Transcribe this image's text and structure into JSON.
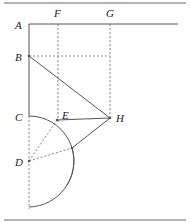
{
  "figure": {
    "stroke_color": "#555555",
    "dash_color": "#777777",
    "rule_color": "#6a6a6a",
    "label_color": "#1a1a1a",
    "canvas": {
      "width": 190,
      "height": 223
    }
  },
  "rules": {
    "top": {
      "x1": 4,
      "y1": 3,
      "x2": 186,
      "y2": 3
    },
    "bottom": {
      "x1": 4,
      "y1": 220,
      "x2": 186,
      "y2": 220
    }
  },
  "points": {
    "A": {
      "label": "A",
      "x": 29,
      "y": 24,
      "label_x": 15,
      "label_y": 29
    },
    "B": {
      "label": "B",
      "x": 29,
      "y": 56,
      "label_x": 15,
      "label_y": 61
    },
    "C": {
      "label": "C",
      "x": 29,
      "y": 116,
      "label_x": 15,
      "label_y": 121
    },
    "D": {
      "label": "D",
      "x": 29,
      "y": 161,
      "label_x": 15,
      "label_y": 166
    },
    "E": {
      "label": "E",
      "x": 57,
      "y": 120,
      "label_x": 62,
      "label_y": 119
    },
    "F": {
      "label": "F",
      "x": 58,
      "y": 24,
      "label_x": 54,
      "label_y": 17
    },
    "G": {
      "label": "G",
      "x": 110,
      "y": 24,
      "label_x": 106,
      "label_y": 17
    },
    "H": {
      "label": "H",
      "x": 110,
      "y": 118,
      "label_x": 116,
      "label_y": 122
    },
    "K": {
      "label": "",
      "x": 72,
      "y": 148,
      "label_x": 0,
      "label_y": 0
    }
  },
  "solid_segments": [
    {
      "name": "top-horizontal-AX",
      "x1": 29,
      "y1": 24,
      "x2": 178,
      "y2": 24
    },
    {
      "name": "vertical-A-to-C",
      "x1": 29,
      "y1": 24,
      "x2": 29,
      "y2": 116
    },
    {
      "name": "diagonal-B-to-H",
      "x1": 29,
      "y1": 56,
      "x2": 110,
      "y2": 118
    },
    {
      "name": "segment-E-to-H",
      "x1": 57,
      "y1": 120,
      "x2": 110,
      "y2": 118
    },
    {
      "name": "segment-H-to-K",
      "x1": 110,
      "y1": 118,
      "x2": 72,
      "y2": 148
    }
  ],
  "dashed_segments": [
    {
      "name": "vertical-F",
      "x1": 58,
      "y1": 24,
      "x2": 58,
      "y2": 122
    },
    {
      "name": "vertical-G",
      "x1": 110,
      "y1": 24,
      "x2": 110,
      "y2": 118
    },
    {
      "name": "horizontal-B-to-G",
      "x1": 29,
      "y1": 56,
      "x2": 110,
      "y2": 56
    },
    {
      "name": "vertical-C-to-bottom",
      "x1": 29,
      "y1": 116,
      "x2": 29,
      "y2": 209
    },
    {
      "name": "radius-D-to-E",
      "x1": 29,
      "y1": 161,
      "x2": 57,
      "y2": 120
    },
    {
      "name": "radius-D-to-K",
      "x1": 29,
      "y1": 161,
      "x2": 72,
      "y2": 148
    }
  ],
  "arcs": [
    {
      "name": "small-arc-centre-D-through-C-E",
      "cx": 29,
      "cy": 161,
      "r": 45,
      "start_x": 29,
      "start_y": 116,
      "end_x": 67,
      "end_y": 185,
      "path": "M 29 116 A 45 45 0 0 1 67 185"
    },
    {
      "name": "large-arc-centre-D-through-K",
      "cx": 29,
      "cy": 161,
      "r": 46,
      "start_x": 72,
      "start_y": 148,
      "end_x": 29,
      "end_y": 207,
      "path": "M 72 148 A 46 46 0 0 1 29 207"
    }
  ],
  "markers": [
    {
      "name": "vertex-dot-B",
      "x": 29,
      "y": 56
    },
    {
      "name": "vertex-dot-D",
      "x": 29,
      "y": 161
    },
    {
      "name": "vertex-dot-E",
      "x": 57,
      "y": 120
    },
    {
      "name": "vertex-dot-H",
      "x": 110,
      "y": 118
    },
    {
      "name": "vertex-dot-K",
      "x": 72,
      "y": 148
    }
  ]
}
